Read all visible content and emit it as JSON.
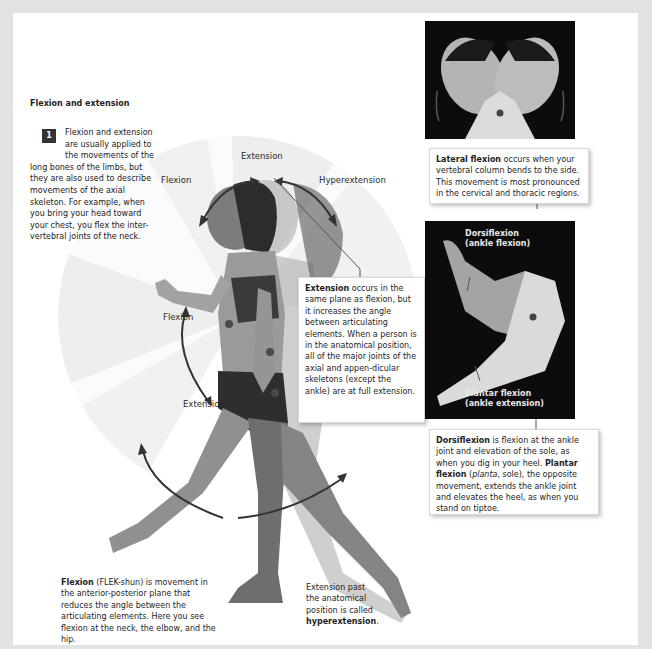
{
  "section": {
    "title": "Flexion and extension",
    "step_number": "1",
    "intro_text": "Flexion and extension are usually applied to the movements of the long bones of the limbs, but they are also used to describe movements of the axial skeleton. For example, when you bring your head toward your chest, you flex the inter-vertebral joints of the neck."
  },
  "figure": {
    "neck_labels": {
      "flexion": "Flexion",
      "extension": "Extension",
      "hyperextension": "Hyperextension"
    },
    "arm_labels": {
      "flexion": "Flexion",
      "extension": "Extension"
    }
  },
  "callouts": {
    "extension": {
      "term": "Extension",
      "text": " occurs in the same plane as flexion, but it increases the angle between articulating elements. When a person is in the anatomical position, all of the major joints of the axial and appen-dicular skeletons (except the ankle) are at full extension."
    },
    "lateral_flexion": {
      "term": "Lateral flexion",
      "text": " occurs when your vertebral column bends to the side. This movement is most pronounced in the cervical and thoracic regions."
    },
    "dorsiflexion": {
      "term": "Dorsiflexion",
      "text1": " is flexion at the ankle joint and elevation of the sole, as when you dig in your heel. ",
      "term2": "Plantar flexion",
      "paren_open": " (",
      "latin": "planta",
      "paren_rest": ", sole), the opposite movement, extends the ankle joint and elevates the heel, as when you stand on tiptoe."
    }
  },
  "foot_photo": {
    "top_label_line1": "Dorsiflexion",
    "top_label_line2": "(ankle flexion)",
    "bottom_label_line1": "Plantar flexion",
    "bottom_label_line2": "(ankle extension)"
  },
  "captions": {
    "flexion": {
      "term": "Flexion",
      "text": " (FLEK-shun) is movement in the anterior-posterior plane that reduces the angle between the articulating elements. Here you see flexion at the neck, the elbow, and the hip."
    },
    "hyperextension": {
      "text": "Extension past the anatomical position is called ",
      "term": "hyperextension",
      "end": "."
    }
  },
  "colors": {
    "background": "#e2e2e2",
    "page": "#ffffff",
    "badge": "#333333",
    "photo_bg": "#0c0c0c"
  }
}
